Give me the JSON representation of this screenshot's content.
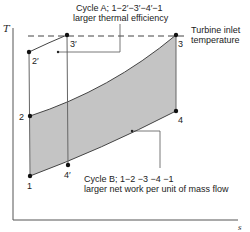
{
  "diagram": {
    "type": "T-s diagram (Brayton cycle comparison)",
    "axes": {
      "y_label": "T",
      "x_label": "s"
    },
    "reference_line": {
      "label_line1": "Turbine inlet",
      "label_line2": "temperature"
    },
    "points": {
      "p1": "1",
      "p2": "2",
      "p3": "3",
      "p4": "4",
      "p2prime": "2′",
      "p3prime": "3′",
      "p4prime": "4′"
    },
    "cycle_a": {
      "line1": "Cycle A; 1−2′−3′−4′−1",
      "line2": "larger thermal efficiency"
    },
    "cycle_b": {
      "line1": "Cycle B; 1−2 −3 −4 −1",
      "line2": "larger net work per unit of mass flow"
    },
    "colors": {
      "shading": "#c4c4c4",
      "line": "#333333",
      "axis": "#555555"
    }
  }
}
